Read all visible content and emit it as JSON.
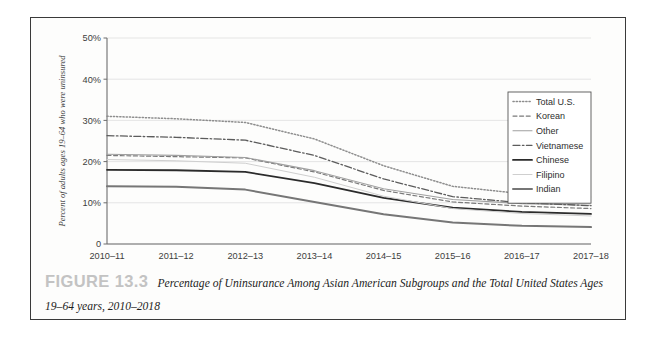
{
  "figure": {
    "number_label": "FIGURE 13.3",
    "caption_text": "Percentage of Uninsurance Among Asian American Subgroups and the Total United States Ages 19–64 years, 2010–2018"
  },
  "chart_data": {
    "type": "line",
    "title": "",
    "xlabel": "",
    "ylabel": "Percent of adults ages 19–64 who were uninsured",
    "ylim": [
      0,
      50
    ],
    "ytick_labels": [
      "0",
      "10%",
      "20%",
      "30%",
      "40%",
      "50%"
    ],
    "ytick_values": [
      0,
      10,
      20,
      30,
      40,
      50
    ],
    "grid": "horizontal",
    "legend_position": "right-inside",
    "categories": [
      "2010–11",
      "2011–12",
      "2012–13",
      "2013–14",
      "2014–15",
      "2015–16",
      "2016–17",
      "2017–18"
    ],
    "series": [
      {
        "name": "Total U.S.",
        "style": "dotted-fine",
        "color": "#8d8d8d",
        "width": 1.5,
        "values": [
          31.0,
          30.4,
          29.5,
          25.5,
          19.0,
          14.0,
          12.2,
          11.4
        ]
      },
      {
        "name": "Korean",
        "style": "dashed",
        "color": "#7a7a7a",
        "width": 1.2,
        "values": [
          21.5,
          21.2,
          20.9,
          17.5,
          13.0,
          10.2,
          9.2,
          8.6
        ]
      },
      {
        "name": "Other",
        "style": "solid-thin",
        "color": "#a0a0a0",
        "width": 1.1,
        "values": [
          21.8,
          21.5,
          21.0,
          17.8,
          13.4,
          10.8,
          9.8,
          9.4
        ]
      },
      {
        "name": "Vietnamese",
        "style": "dash-dot",
        "color": "#5c5c5c",
        "width": 1.3,
        "values": [
          26.3,
          25.9,
          25.2,
          21.5,
          15.8,
          11.5,
          10.0,
          9.3
        ]
      },
      {
        "name": "Chinese",
        "style": "solid-bold",
        "color": "#2b2b2b",
        "width": 1.8,
        "values": [
          18.0,
          17.9,
          17.5,
          14.8,
          11.2,
          8.8,
          7.8,
          7.3
        ]
      },
      {
        "name": "Filipino",
        "style": "solid-light",
        "color": "#cfcfcf",
        "width": 1.0,
        "values": [
          20.5,
          20.2,
          19.6,
          16.2,
          11.6,
          8.6,
          7.4,
          6.8
        ]
      },
      {
        "name": "Indian",
        "style": "solid-medium",
        "color": "#767676",
        "width": 2.0,
        "values": [
          14.0,
          13.9,
          13.2,
          10.2,
          7.2,
          5.2,
          4.4,
          4.1
        ]
      }
    ]
  },
  "legend": {
    "entries": [
      "Total U.S.",
      "Korean",
      "Other",
      "Vietnamese",
      "Chinese",
      "Filipino",
      "Indian"
    ]
  },
  "colors": {
    "frame": "#3a3a3a",
    "gridline": "#e2e2e2",
    "axis": "#6d6d6d",
    "figure_number": "#c3c3c3"
  }
}
